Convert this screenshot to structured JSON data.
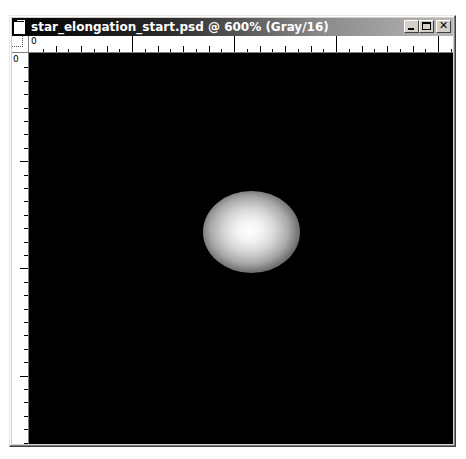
{
  "window": {
    "title": "star_elongation_start.psd @ 600% (Gray/16)",
    "controls": {
      "minimize": "_",
      "maximize": "□",
      "close": "×"
    }
  },
  "rulers": {
    "top_origin_label": "0",
    "left_origin_label": "0",
    "top_major_tick_x": [
      0,
      102,
      204,
      306
    ],
    "left_major_tick_y": [
      0,
      107,
      214,
      321
    ]
  },
  "canvas": {
    "background": "#000000",
    "content": "star blob",
    "star": {
      "center_x": 249,
      "center_y": 228,
      "width": 97,
      "height": 82
    }
  },
  "colors": {
    "titlebar_start": "#000000",
    "titlebar_end": "#b8b8b8",
    "chrome": "#d4d0c8"
  }
}
